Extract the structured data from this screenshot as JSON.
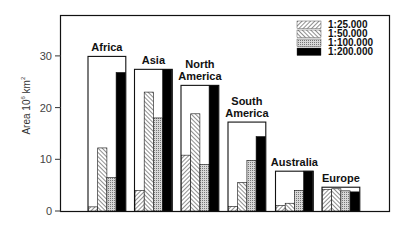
{
  "chart_data": {
    "type": "bar",
    "title": "",
    "xlabel": "",
    "ylabel": "Area 10⁶ km²",
    "ylim": [
      0,
      37
    ],
    "yticks": [
      0,
      10,
      20,
      30
    ],
    "grid": false,
    "legend_position": "upper right inside",
    "categories": [
      "Africa",
      "Asia",
      "North America",
      "South America",
      "Australia",
      "Europe"
    ],
    "category_labels": [
      [
        "Africa"
      ],
      [
        "Asia"
      ],
      [
        "North",
        "America"
      ],
      [
        "South",
        "America"
      ],
      [
        "Australia"
      ],
      [
        "Europe"
      ]
    ],
    "outline_total": [
      29.9,
      27.4,
      24.3,
      17.2,
      7.7,
      4.6
    ],
    "series": [
      {
        "name": "1:25.000",
        "pattern": "hatch-forward",
        "values": [
          0.8,
          4.0,
          10.8,
          0.9,
          1.1,
          4.2
        ]
      },
      {
        "name": "1:50.000",
        "pattern": "hatch-backward",
        "values": [
          12.2,
          23.0,
          18.8,
          5.5,
          1.5,
          4.3
        ]
      },
      {
        "name": "1:100.000",
        "pattern": "dense-gray",
        "values": [
          6.5,
          18.0,
          9.0,
          9.8,
          4.0,
          3.9
        ]
      },
      {
        "name": "1:200.000",
        "pattern": "solid-black",
        "values": [
          26.8,
          27.4,
          24.3,
          14.4,
          7.7,
          3.7
        ]
      }
    ]
  }
}
